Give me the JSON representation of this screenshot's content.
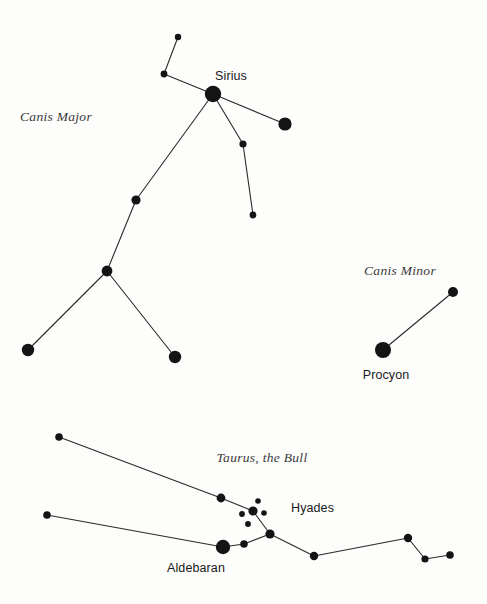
{
  "page": {
    "background_color": "#fdfdfc",
    "ink_color": "#141414",
    "line_color": "#2a2a2a",
    "width": 487,
    "height": 604
  },
  "chart_data": {
    "type": "scatter",
    "xlabel": "",
    "ylabel": "",
    "grid": false,
    "legend": "none",
    "xlim": [
      0,
      487
    ],
    "ylim": [
      0,
      604
    ],
    "constellations": [
      {
        "name": "Canis Major",
        "label": "Canis Major",
        "label_x": 56,
        "label_y": 121,
        "label_style": "italic-serif",
        "stars": [
          {
            "id": "cma-theta",
            "name": "",
            "x": 178,
            "y": 37,
            "r": 3.2
          },
          {
            "id": "cma-iota",
            "name": "",
            "x": 164,
            "y": 74,
            "r": 3.4
          },
          {
            "id": "cma-sirius",
            "name": "Sirius",
            "x": 213,
            "y": 94,
            "r": 8.2,
            "label_x": 231,
            "label_y": 80,
            "label_anchor": "middle"
          },
          {
            "id": "cma-mirzam",
            "name": "",
            "x": 285,
            "y": 124,
            "r": 6.6
          },
          {
            "id": "cma-nu",
            "name": "",
            "x": 243,
            "y": 144,
            "r": 3.6
          },
          {
            "id": "cma-omicron",
            "name": "",
            "x": 253,
            "y": 215,
            "r": 3.4
          },
          {
            "id": "cma-wezen",
            "name": "",
            "x": 136,
            "y": 200,
            "r": 4.6
          },
          {
            "id": "cma-adhara",
            "name": "",
            "x": 107,
            "y": 271,
            "r": 5.4
          },
          {
            "id": "cma-aludra",
            "name": "",
            "x": 28,
            "y": 350,
            "r": 6.2
          },
          {
            "id": "cma-furud",
            "name": "",
            "x": 175,
            "y": 357,
            "r": 6.2
          }
        ],
        "links": [
          [
            "cma-theta",
            "cma-iota"
          ],
          [
            "cma-iota",
            "cma-sirius"
          ],
          [
            "cma-sirius",
            "cma-mirzam"
          ],
          [
            "cma-sirius",
            "cma-nu"
          ],
          [
            "cma-nu",
            "cma-omicron"
          ],
          [
            "cma-sirius",
            "cma-wezen"
          ],
          [
            "cma-wezen",
            "cma-adhara"
          ],
          [
            "cma-adhara",
            "cma-aludra"
          ],
          [
            "cma-adhara",
            "cma-furud"
          ]
        ]
      },
      {
        "name": "Canis Minor",
        "label": "Canis Minor",
        "label_x": 400,
        "label_y": 275,
        "label_style": "italic-serif",
        "stars": [
          {
            "id": "cmi-procyon",
            "name": "Procyon",
            "x": 383,
            "y": 350,
            "r": 8.0,
            "label_x": 386,
            "label_y": 379,
            "label_anchor": "middle"
          },
          {
            "id": "cmi-gomeisa",
            "name": "",
            "x": 453,
            "y": 292,
            "r": 5.0
          }
        ],
        "links": [
          [
            "cmi-procyon",
            "cmi-gomeisa"
          ]
        ]
      },
      {
        "name": "Taurus, the Bull",
        "label": "Taurus, the Bull",
        "label_x": 262,
        "label_y": 462,
        "label_style": "italic-serif",
        "stars": [
          {
            "id": "tau-elnath",
            "name": "",
            "x": 59,
            "y": 437,
            "r": 3.8
          },
          {
            "id": "tau-zeta",
            "name": "",
            "x": 47,
            "y": 515,
            "r": 3.8
          },
          {
            "id": "tau-tau",
            "name": "",
            "x": 221,
            "y": 498,
            "r": 4.4
          },
          {
            "id": "tau-hy-a",
            "name": "",
            "x": 258,
            "y": 501,
            "r": 2.8
          },
          {
            "id": "tau-hy-b",
            "name": "",
            "x": 253,
            "y": 511,
            "r": 4.6
          },
          {
            "id": "tau-hy-c",
            "name": "",
            "x": 242,
            "y": 514,
            "r": 2.9
          },
          {
            "id": "tau-hy-d",
            "name": "",
            "x": 264,
            "y": 513,
            "r": 2.8
          },
          {
            "id": "tau-hy-e",
            "name": "",
            "x": 248,
            "y": 524,
            "r": 2.9
          },
          {
            "id": "tau-theta",
            "name": "",
            "x": 270,
            "y": 534,
            "r": 4.6
          },
          {
            "id": "tau-aldebaran",
            "name": "Aldebaran",
            "x": 223,
            "y": 547,
            "r": 7.2,
            "label_x": 196,
            "label_y": 572,
            "label_anchor": "middle"
          },
          {
            "id": "tau-gamma",
            "name": "",
            "x": 244,
            "y": 544,
            "r": 3.8
          },
          {
            "id": "tau-lambda",
            "name": "",
            "x": 314,
            "y": 556,
            "r": 4.2
          },
          {
            "id": "tau-xi",
            "name": "",
            "x": 408,
            "y": 538,
            "r": 4.2
          },
          {
            "id": "tau-omicron",
            "name": "",
            "x": 425,
            "y": 559,
            "r": 3.6
          },
          {
            "id": "tau-nu",
            "name": "",
            "x": 450,
            "y": 555,
            "r": 3.8
          }
        ],
        "links": [
          [
            "tau-elnath",
            "tau-tau"
          ],
          [
            "tau-tau",
            "tau-hy-b"
          ],
          [
            "tau-hy-b",
            "tau-theta"
          ],
          [
            "tau-theta",
            "tau-gamma"
          ],
          [
            "tau-gamma",
            "tau-aldebaran"
          ],
          [
            "tau-aldebaran",
            "tau-zeta"
          ],
          [
            "tau-theta",
            "tau-lambda"
          ],
          [
            "tau-lambda",
            "tau-xi"
          ],
          [
            "tau-xi",
            "tau-omicron"
          ],
          [
            "tau-omicron",
            "tau-nu"
          ]
        ]
      }
    ],
    "cluster_labels": [
      {
        "id": "hyades",
        "label": "Hyades",
        "x": 291,
        "y": 512,
        "anchor": "start",
        "style": "sans"
      }
    ]
  }
}
